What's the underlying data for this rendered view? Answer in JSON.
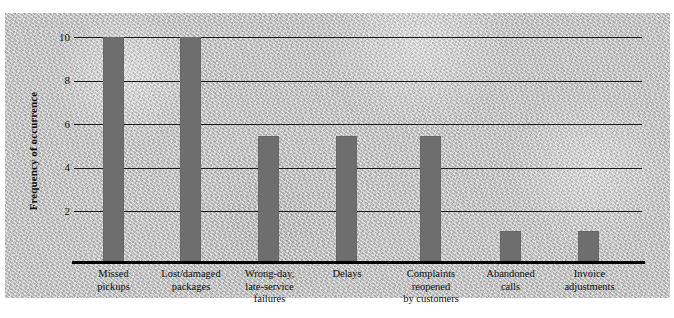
{
  "chart_data": {
    "type": "bar",
    "title": "",
    "subtitle": "",
    "xlabel": "",
    "ylabel": "Frequency of occurrence",
    "ylim": [
      0,
      10.6
    ],
    "yticks": [
      2,
      4,
      6,
      8,
      10
    ],
    "ytick_labels": [
      "2",
      "4",
      "6",
      "8",
      "10"
    ],
    "grid": "horizontal",
    "legend": "none",
    "bar_color": "#6e6e6e",
    "background_color": "#c2c2c2",
    "axis_color": "#000000",
    "categories": [
      "Missed pickups",
      "Lost/damaged packages",
      "Wrong-day, late-service failures",
      "Delays",
      "Complaints reopened by customers",
      "Abandoned calls",
      "Invoice adjustments"
    ],
    "values": [
      10,
      10,
      5.5,
      5.5,
      5.5,
      1.4,
      1.4
    ],
    "bars": [
      {
        "label_lines": [
          "Missed",
          "pickups"
        ],
        "value": 10
      },
      {
        "label_lines": [
          "Lost/damaged",
          "packages"
        ],
        "value": 10
      },
      {
        "label_lines": [
          "Wrong-day,",
          "late-service",
          "failures"
        ],
        "value": 5.5
      },
      {
        "label_lines": [
          "Delays"
        ],
        "value": 5.5
      },
      {
        "label_lines": [
          "Complaints",
          "reopened",
          "by customers"
        ],
        "value": 5.5
      },
      {
        "label_lines": [
          "Abandoned",
          "calls"
        ],
        "value": 1.4
      },
      {
        "label_lines": [
          "Invoice",
          "adjustments"
        ],
        "value": 1.4
      }
    ],
    "category_labels": {
      "c0": "Missed\npickups",
      "c1": "Lost/damaged\npackages",
      "c2": "Wrong-day,\nlate-service\nfailures",
      "c3": "Delays",
      "c4": "Complaints\nreopened\nby customers",
      "c5": "Abandoned\ncalls",
      "c6": "Invoice\nadjustments"
    }
  },
  "axis": {
    "y_title": "Frequency of occurrence",
    "tick_10": "10",
    "tick_8": "8",
    "tick_6": "6",
    "tick_4": "4",
    "tick_2": "2"
  }
}
